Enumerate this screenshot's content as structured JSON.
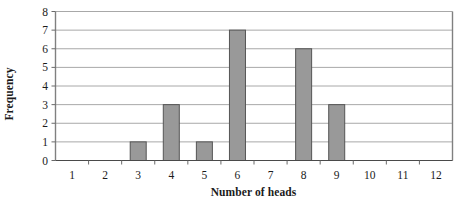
{
  "chart_data": {
    "type": "bar",
    "title": "",
    "xlabel": "Number of heads",
    "ylabel": "Frequency",
    "categories": [
      "1",
      "2",
      "3",
      "4",
      "5",
      "6",
      "7",
      "8",
      "9",
      "10",
      "11",
      "12"
    ],
    "values": [
      0,
      0,
      1,
      3,
      1,
      7,
      0,
      6,
      3,
      0,
      0,
      0
    ],
    "ylim": [
      0,
      8
    ],
    "yticks": [
      "0",
      "1",
      "2",
      "3",
      "4",
      "5",
      "6",
      "7",
      "8"
    ],
    "grid": "horizontal",
    "legend": "none",
    "bar_color": "#999999",
    "bar_edge_color": "#555555",
    "axis_color": "#808080",
    "grid_color": "#a8a8a8",
    "text_color": "#1b1b1b"
  }
}
